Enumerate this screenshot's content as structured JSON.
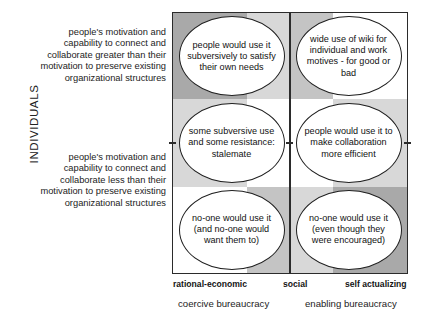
{
  "axes": {
    "y_title": "INDIVIDUALS",
    "y_categories": [
      {
        "key": "self-actualizing",
        "label": "self actualizing"
      },
      {
        "key": "social",
        "label": "social"
      },
      {
        "key": "rational-economic",
        "label": "rational-economic"
      }
    ],
    "x_categories": [
      {
        "key": "rational-economic",
        "label": "rational-economic"
      },
      {
        "key": "social",
        "label": "social"
      },
      {
        "key": "self-actualizing",
        "label": "self actualizing"
      }
    ],
    "x_groups": [
      {
        "key": "coercive",
        "label": "coercive bureaucracy"
      },
      {
        "key": "enabling",
        "label": "enabling bureaucracy"
      }
    ]
  },
  "side_notes": {
    "upper": "people's motivation and capability to connect and collaborate greater than their motivation to preserve existing organizational structures",
    "lower": "people's motivation and capability to connect and collaborate less than their motivation to preserve existing organizational structures"
  },
  "cells": [
    {
      "key": "top-left",
      "row": "self-actualizing",
      "col": "coercive",
      "text": "people would use it subversively to satisfy their own needs"
    },
    {
      "key": "top-right",
      "row": "self-actualizing",
      "col": "enabling",
      "text": "wide use of wiki for individual and work motives - for good or bad"
    },
    {
      "key": "middle-left",
      "row": "social",
      "col": "coercive",
      "text": "some subversive use and some resistance: stalemate"
    },
    {
      "key": "middle-right",
      "row": "social",
      "col": "enabling",
      "text": "people would use it to make collaboration more efficient"
    },
    {
      "key": "bottom-left",
      "row": "rational-economic",
      "col": "coercive",
      "text": "no-one would use it (and no-one would want them to)"
    },
    {
      "key": "bottom-right",
      "row": "rational-economic",
      "col": "enabling",
      "text": "no-one would use it (even though they were encouraged)"
    }
  ],
  "chart_data": {
    "type": "table",
    "title": "",
    "xlabel": "coercive bureaucracy / enabling bureaucracy",
    "ylabel": "INDIVIDUALS",
    "x_ticks": [
      "rational-economic",
      "social",
      "self actualizing"
    ],
    "y_ticks": [
      "rational-economic",
      "social",
      "self actualizing"
    ],
    "grid": true,
    "rows": [
      "self actualizing",
      "social",
      "rational-economic"
    ],
    "columns": [
      "coercive bureaucracy",
      "enabling bureaucracy"
    ],
    "values": [
      [
        "people would use it subversively to satisfy their own needs",
        "wide use of wiki for individual and work motives - for good or bad"
      ],
      [
        "some subversive use and some resistance: stalemate",
        "people would use it to make collaboration more efficient"
      ],
      [
        "no-one would use it (and no-one would want them to)",
        "no-one would use it (even though they were encouraged)"
      ]
    ]
  },
  "shading": {
    "dark": "#a9a9a9",
    "mid": "#c4c4c4",
    "light": "#d8d8d8",
    "white": "#ffffff",
    "blocks": [
      {
        "name": "r1c1-dark",
        "left": 0,
        "top": 0,
        "width": 31.5,
        "height": 33.2,
        "color": "#a9a9a9"
      },
      {
        "name": "r1c2-light",
        "left": 31.5,
        "top": 0,
        "width": 18.5,
        "height": 33.2,
        "color": "#d8d8d8"
      },
      {
        "name": "r1c3-mid",
        "left": 50,
        "top": 0,
        "width": 18.5,
        "height": 33.2,
        "color": "#c4c4c4"
      },
      {
        "name": "r1c4-white",
        "left": 68.5,
        "top": 0,
        "width": 31.5,
        "height": 33.2,
        "color": "#ffffff"
      },
      {
        "name": "r2c1-light",
        "left": 0,
        "top": 33.2,
        "width": 31.5,
        "height": 33.6,
        "color": "#d8d8d8"
      },
      {
        "name": "r2c2-white",
        "left": 31.5,
        "top": 33.2,
        "width": 18.5,
        "height": 33.6,
        "color": "#ffffff"
      },
      {
        "name": "r2c3-white",
        "left": 50,
        "top": 33.2,
        "width": 18.5,
        "height": 33.6,
        "color": "#ffffff"
      },
      {
        "name": "r2c4-light",
        "left": 68.5,
        "top": 33.2,
        "width": 31.5,
        "height": 33.6,
        "color": "#d8d8d8"
      },
      {
        "name": "r3c1-white",
        "left": 0,
        "top": 66.8,
        "width": 31.5,
        "height": 33.2,
        "color": "#ffffff"
      },
      {
        "name": "r3c2-mid",
        "left": 31.5,
        "top": 66.8,
        "width": 18.5,
        "height": 33.2,
        "color": "#c4c4c4"
      },
      {
        "name": "r3c3-light",
        "left": 50,
        "top": 66.8,
        "width": 18.5,
        "height": 33.2,
        "color": "#d8d8d8"
      },
      {
        "name": "r3c4-dark",
        "left": 68.5,
        "top": 66.8,
        "width": 31.5,
        "height": 33.2,
        "color": "#a9a9a9"
      }
    ]
  }
}
